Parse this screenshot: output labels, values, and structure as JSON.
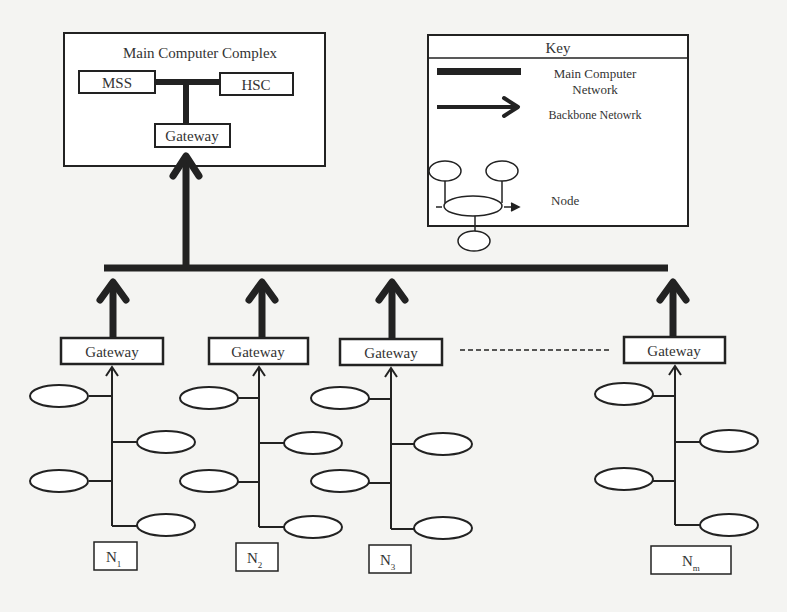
{
  "main_complex": {
    "title": "Main Computer Complex",
    "left_unit": "MSS",
    "right_unit": "HSC",
    "gateway": "Gateway"
  },
  "key": {
    "title": "Key",
    "entries": [
      {
        "symbol": "thick-bar",
        "label_line1": "Main Computer",
        "label_line2": "Network"
      },
      {
        "symbol": "arrow",
        "label": "Backbone Netowrk"
      },
      {
        "symbol": "node-cluster",
        "label": "Node"
      }
    ]
  },
  "subnetworks": [
    {
      "gateway": "Gateway",
      "label": "N",
      "subscript": "1"
    },
    {
      "gateway": "Gateway",
      "label": "N",
      "subscript": "2"
    },
    {
      "gateway": "Gateway",
      "label": "N",
      "subscript": "3"
    },
    {
      "gateway": "Gateway",
      "label": "N",
      "subscript": "m"
    }
  ],
  "colors": {
    "line": "#222222",
    "background": "#f4f4f2",
    "box_fill": "#ffffff"
  }
}
